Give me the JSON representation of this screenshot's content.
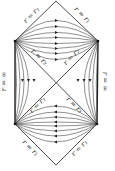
{
  "colors": {
    "line": "#222222",
    "curve": "#444444",
    "arrow": "#222222",
    "background": "#ffffff"
  },
  "geometry": {
    "top_apex": [
      56,
      1
    ],
    "left_upper_vertex": [
      15,
      41
    ],
    "right_upper_vertex": [
      98,
      41
    ],
    "center": [
      56,
      83
    ],
    "left_lower_vertex": [
      15,
      124
    ],
    "right_lower_vertex": [
      97,
      124
    ],
    "bottom_apex": [
      56,
      165
    ]
  },
  "labels": {
    "top_left_edge": "r = r₁",
    "top_right_edge": "r = r₁",
    "inner_upper_left": "r = r₂",
    "inner_upper_right": "r = r₂",
    "left_vertical": "r = ∞",
    "right_vertical": "r = ∞",
    "inner_lower_left": "r = r₂",
    "inner_lower_right": "r = r₂",
    "bottom_left_edge": "r = r₁",
    "bottom_right_edge": "r = r₁"
  },
  "flows": {
    "upper_region_direction": "right",
    "lower_region_direction": "left",
    "side_regions_direction": "down",
    "upper_curve_count": 8,
    "lower_curve_count": 8,
    "side_curve_count_each": 4
  }
}
